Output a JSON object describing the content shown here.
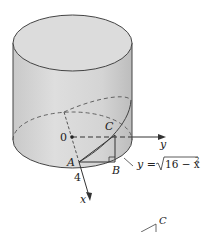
{
  "figure": {
    "type": "cylinder-wedge-diagram",
    "labels": {
      "origin": "0",
      "point_A": "A",
      "point_B": "B",
      "point_C": "C",
      "radius_value": "4",
      "x_axis": "x",
      "y_axis": "y",
      "curve_equation_prefix": "y =",
      "curve_equation_radicand": "16 − x",
      "curve_equation_exponent": "2",
      "inset_point_C": "C"
    },
    "colors": {
      "cylinder_fill": "#d2d2d2",
      "cylinder_top_fill": "#dcdcdc",
      "stroke": "#333333",
      "background": "#ffffff"
    }
  }
}
